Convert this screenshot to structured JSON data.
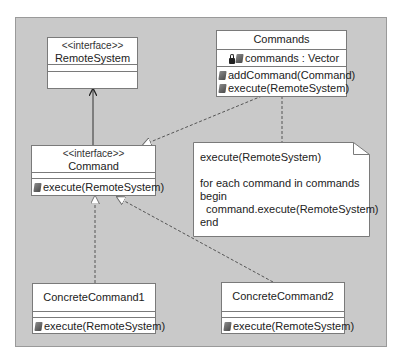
{
  "diagram": {
    "type": "UML class diagram",
    "background_color": "#c9c9c9",
    "classes": [
      {
        "id": "remote_system",
        "stereotype": "<<interface>>",
        "name": "RemoteSystem",
        "attributes": [],
        "operations": []
      },
      {
        "id": "commands",
        "stereotype": "",
        "name": "Commands",
        "attributes": [
          {
            "visibility_icon": "lock-icon",
            "member_icon": "attribute-icon",
            "label": "commands : Vector"
          }
        ],
        "operations": [
          {
            "member_icon": "operation-icon",
            "label": "addCommand(Command)"
          },
          {
            "member_icon": "operation-icon",
            "label": "execute(RemoteSystem)"
          }
        ]
      },
      {
        "id": "command",
        "stereotype": "<<interface>>",
        "name": "Command",
        "attributes": [],
        "operations": [
          {
            "member_icon": "operation-icon",
            "label": "execute(RemoteSystem)"
          }
        ]
      },
      {
        "id": "concrete_command_1",
        "stereotype": "",
        "name": "ConcreteCommand1",
        "attributes": [],
        "operations": [
          {
            "member_icon": "operation-icon",
            "label": "execute(RemoteSystem)"
          }
        ]
      },
      {
        "id": "concrete_command_2",
        "stereotype": "",
        "name": "ConcreteCommand2",
        "attributes": [],
        "operations": [
          {
            "member_icon": "operation-icon",
            "label": "execute(RemoteSystem)"
          }
        ]
      }
    ],
    "note": {
      "lines": [
        "execute(RemoteSystem)",
        "",
        "for each command in commands",
        "begin",
        "  command.execute(RemoteSystem)",
        "end"
      ]
    },
    "relationships": [
      {
        "from": "command",
        "to": "remote_system",
        "kind": "dependency",
        "line": "solid",
        "head": "open-arrow"
      },
      {
        "from": "commands",
        "to": "command",
        "kind": "realization",
        "line": "dashed",
        "head": "hollow-triangle"
      },
      {
        "from": "concrete_command_1",
        "to": "command",
        "kind": "realization",
        "line": "dashed",
        "head": "hollow-triangle"
      },
      {
        "from": "concrete_command_2",
        "to": "command",
        "kind": "realization",
        "line": "dashed",
        "head": "hollow-triangle"
      },
      {
        "from": "commands",
        "to": "note",
        "kind": "note-anchor",
        "line": "dashed",
        "head": "none"
      }
    ]
  }
}
